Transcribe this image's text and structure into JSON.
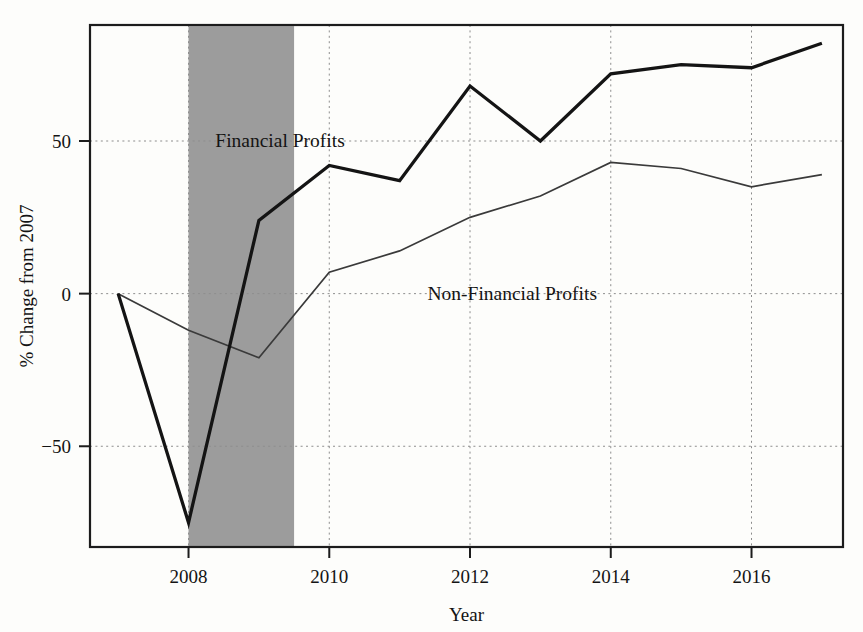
{
  "chart_data": {
    "type": "line",
    "title": "",
    "xlabel": "Year",
    "ylabel": "% Change from 2007",
    "xlim": [
      2006.6,
      2017.3
    ],
    "ylim": [
      -83,
      88
    ],
    "xticks": [
      2008,
      2010,
      2012,
      2014,
      2016
    ],
    "xtick_labels": [
      "2008",
      "2010",
      "2012",
      "2014",
      "2016"
    ],
    "yticks": [
      50,
      0,
      -50
    ],
    "ytick_labels": [
      "50",
      "0",
      "−50"
    ],
    "grid": true,
    "legend": "inline-annotations",
    "x": [
      2007,
      2008,
      2009,
      2010,
      2011,
      2012,
      2013,
      2014,
      2015,
      2016,
      2017
    ],
    "series": [
      {
        "name": "Financial Profits",
        "style": "thick",
        "color": "#141414",
        "values": [
          0,
          -75,
          24,
          42,
          37,
          68,
          50,
          72,
          75,
          74,
          82
        ],
        "label": "Financial Profits",
        "label_x": 2009.3,
        "label_y": 50
      },
      {
        "name": "Non-Financial Profits",
        "style": "thin",
        "color": "#3a3a3a",
        "values": [
          0,
          -12,
          -21,
          7,
          14,
          25,
          32,
          43,
          41,
          35,
          39
        ],
        "label": "Non-Financial Profits",
        "label_x": 2012.6,
        "label_y": 0
      }
    ],
    "shaded_regions": [
      {
        "name": "recession-band",
        "x_start": 2008.0,
        "x_end": 2009.5,
        "color": "#9c9c9c"
      }
    ]
  },
  "axes": {
    "y_title": "% Change from 2007",
    "x_title": "Year"
  }
}
